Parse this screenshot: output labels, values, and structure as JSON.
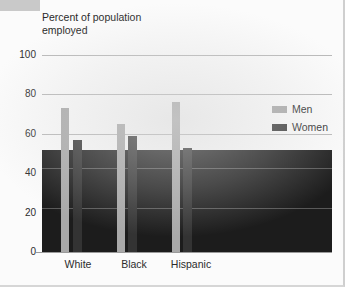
{
  "figure": {
    "title_line1": "Percent of population",
    "title_line2": "employed",
    "title": "Percent of population\nemployed"
  },
  "legend": {
    "position": "right",
    "items": [
      {
        "label": "Men",
        "color": "#a9a9a9"
      },
      {
        "label": "Women",
        "color": "#3a3a3a"
      }
    ]
  },
  "axis": {
    "y_ticks": [
      "100",
      "80",
      "60",
      "40",
      "20",
      "0"
    ],
    "x_ticks": [
      "White",
      "Black",
      "Hispanic"
    ]
  },
  "chart_data": {
    "type": "bar",
    "title": "Percent of population employed",
    "xlabel": "",
    "ylabel": "Percent of population employed",
    "categories": [
      "White",
      "Black",
      "Hispanic"
    ],
    "series": [
      {
        "name": "Men",
        "color": "#a9a9a9",
        "values": [
          73,
          65,
          76
        ]
      },
      {
        "name": "Women",
        "color": "#333333",
        "values": [
          57,
          59,
          53
        ]
      }
    ],
    "ylim": [
      0,
      100
    ],
    "ytick_values": [
      100,
      80,
      60,
      40,
      20,
      0
    ],
    "grid": true,
    "legend_position": "right"
  },
  "artifact": {
    "dark_block_label": "scan-ink-block",
    "dark_block_top_value": 52,
    "dark_block_color": "#1c1c1c"
  }
}
